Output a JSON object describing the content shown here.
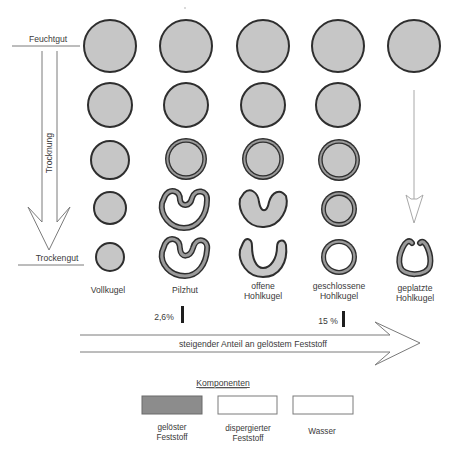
{
  "diagram": {
    "stages": {
      "top": "Feuchtgut",
      "bottom": "Trockengut",
      "process": "Trocknung"
    },
    "columns": [
      {
        "id": "vollkugel",
        "line1": "Vollkugel",
        "line2": ""
      },
      {
        "id": "pilzhut",
        "line1": "Pilzhut",
        "line2": ""
      },
      {
        "id": "offene-hohlkugel",
        "line1": "offene",
        "line2": "Hohlkugel"
      },
      {
        "id": "geschlossene-hohlkugel",
        "line1": "geschlossene",
        "line2": "Hohlkugel"
      },
      {
        "id": "geplatzte-hohlkugel",
        "line1": "geplatzte",
        "line2": "Hohlkugel"
      }
    ],
    "thresholds": [
      {
        "label": "2,6%",
        "between": [
          "Pilzhut",
          "offene Hohlkugel"
        ]
      },
      {
        "label": "15 %",
        "between": [
          "geschlossene Hohlkugel",
          "geplatzte Hohlkugel"
        ]
      }
    ],
    "axis_label": "steigender Anteil an gelöstem Feststoff",
    "legend": {
      "title": "Komponenten",
      "items": [
        {
          "line1": "gelöster",
          "line2": "Feststoff",
          "color": "#8c8c8c"
        },
        {
          "line1": "dispergierter",
          "line2": "Feststoff",
          "color": "#ffffff"
        },
        {
          "line1": "Wasser",
          "line2": "",
          "color": "#ffffff"
        }
      ]
    },
    "colors": {
      "droplet_fill": "#c6c6c6",
      "outline": "#2e2e2e",
      "shell": "#9a9a9a",
      "arrow": "#7a7a7a"
    }
  }
}
